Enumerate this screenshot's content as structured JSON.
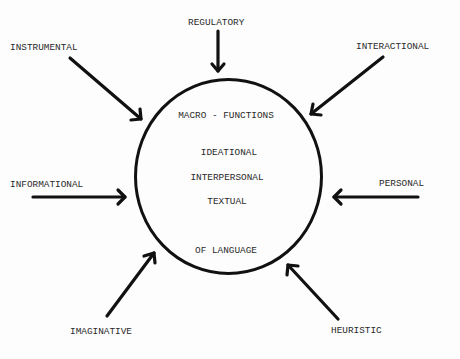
{
  "diagram": {
    "title": "MACRO - FUNCTIONS",
    "center_items": [
      "IDEATIONAL",
      "INTERPERSONAL",
      "TEXTUAL"
    ],
    "footer": "OF LANGUAGE",
    "micro_functions": {
      "regulatory": "REGULATORY",
      "instrumental": "INSTRUMENTAL",
      "interactional": "INTERACTIONAL",
      "informational": "INFORMATIONAL",
      "personal": "PERSONAL",
      "imaginative": "IMAGINATIVE",
      "heuristic": "HEURISTIC"
    },
    "colors": {
      "stroke": "#111111",
      "text": "#2a2a2a",
      "background": "#fdfdfd"
    }
  }
}
